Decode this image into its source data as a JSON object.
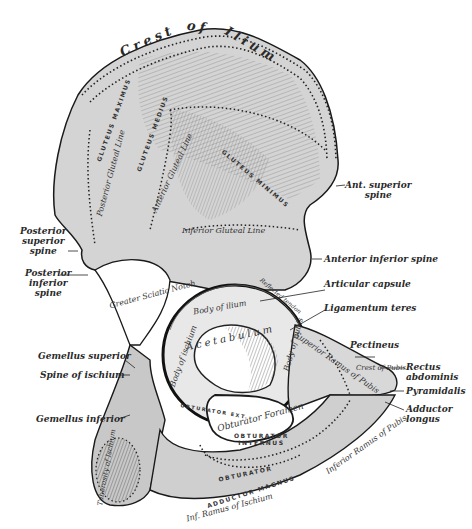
{
  "figure": {
    "colors": {
      "background": "#ffffff",
      "bone_fill": "#d9d9d9",
      "bone_shade": "#8a8a8a",
      "outline": "#1a1a1a",
      "label_text": "#2a2a2a"
    }
  },
  "labels": {
    "crest_of_ilium": [
      "Crest",
      "of",
      "Ilium"
    ],
    "ant_superior_spine": [
      "Ant. superior",
      "spine"
    ],
    "posterior_superior_spine": [
      "Posterior",
      "superior",
      "spine"
    ],
    "posterior_inferior_spine": [
      "Posterior",
      "inferior",
      "spine"
    ],
    "anterior_inferior_spine": "Anterior inferior spine",
    "articular_capsule": "Articular capsule",
    "ligamentum_teres": "Ligamentum teres",
    "pectineus": "Pectineus",
    "rectus_abdominis": [
      "Rectus",
      "abdominis"
    ],
    "pyramidalis": "Pyramidalis",
    "adductor_longus": [
      "Adductor",
      "longus"
    ],
    "gemellus_superior": "Gemellus superior",
    "spine_of_ischium": "Spine of ischium",
    "gemellus_inferior": "Gemellus inferior"
  },
  "inner_labels": {
    "gluteal_line_posterior": "Posterior Gluteal Line",
    "gluteal_line_anterior": "Anterior Gluteal Line",
    "gluteal_line_inferior": "Inferior Gluteal Line",
    "greater_sciatic_notch": "Greater Sciatic Notch",
    "body_of_ilium": "Body of ilium",
    "acetabulum": "Acetabulum",
    "body_of_ischium": "Body of ischium",
    "body_of_pubis": "Body of pubis",
    "superior_ramus_of_pubis": "Superior Ramus of Pubis",
    "crest_of_pubis": "Crest of Pubis",
    "obturator_foramen": "Obturator Foramen",
    "inferior_ramus_of_pubis": "Inferior Ramus of Pubis",
    "inf_ramus_of_ischium": "Inf. Ramus of Ischium",
    "tuberosity_of_ischium": "Tuberosity of Ischium"
  },
  "muscle_labels": {
    "gluteus_medius": "GLUTEUS MEDIUS",
    "gluteus_minimus": "GLUTEUS MINIMUS",
    "gluteus_maximus": "GLUTEUS MAXIMUS",
    "obturator_internus": [
      "OBTURATOR",
      "INTERNUS"
    ],
    "obturator_externus": "OBTURATOR EXT.",
    "obturator": "OBTURATOR",
    "adductor_magnus": "ADDUCTOR MAGNUS",
    "reflected_tendon": "Reflected tendon"
  }
}
